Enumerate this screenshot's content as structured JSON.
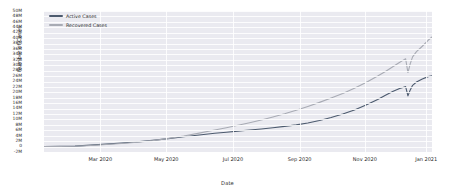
{
  "chart_data": {
    "type": "line",
    "title": "",
    "xlabel": "Date",
    "ylabel": "Number of Cases",
    "grid": true,
    "legend_position": "upper-left-inside",
    "x_tick_labels": [
      "Mar 2020",
      "May 2020",
      "Jul 2020",
      "Sep 2020",
      "Nov 2020",
      "Jan 2021"
    ],
    "x_tick_positions": [
      0.145,
      0.315,
      0.487,
      0.659,
      0.827,
      0.985
    ],
    "xlim_start": "2020-01-22",
    "xlim_end": "2021-01-10",
    "y_tick_labels": [
      "50M",
      "48M",
      "46M",
      "44M",
      "42M",
      "40M",
      "38M",
      "36M",
      "34M",
      "32M",
      "30M",
      "28M",
      "26M",
      "24M",
      "22M",
      "20M",
      "18M",
      "16M",
      "14M",
      "12M",
      "10M",
      "8M",
      "6M",
      "4M",
      "2M",
      "0",
      "-2M"
    ],
    "y_tick_values": [
      50000000,
      48000000,
      46000000,
      44000000,
      42000000,
      40000000,
      38000000,
      36000000,
      34000000,
      32000000,
      30000000,
      28000000,
      26000000,
      24000000,
      22000000,
      20000000,
      18000000,
      16000000,
      14000000,
      12000000,
      10000000,
      8000000,
      6000000,
      4000000,
      2000000,
      0,
      -2000000
    ],
    "ylim": [
      -2000000,
      50000000
    ],
    "colors": {
      "active": "#4c5a6e",
      "recovered": "#a8abb4",
      "plot_background": "#eaeaf0",
      "gridline": "#ffffff",
      "text": "#2b2b2b"
    },
    "series": [
      {
        "name": "Active Cases",
        "color": "#4c5a6e",
        "x": [
          0.0,
          0.04,
          0.08,
          0.12,
          0.16,
          0.2,
          0.24,
          0.28,
          0.32,
          0.36,
          0.4,
          0.44,
          0.47,
          0.5,
          0.53,
          0.56,
          0.59,
          0.62,
          0.65,
          0.68,
          0.71,
          0.74,
          0.77,
          0.8,
          0.83,
          0.86,
          0.88,
          0.9,
          0.915,
          0.925,
          0.932,
          0.938,
          0.944,
          0.95,
          0.96,
          0.975,
          0.99,
          1.0
        ],
        "values": [
          20000,
          60000,
          160000,
          520000,
          900000,
          1300000,
          1750000,
          2300000,
          2950000,
          3600000,
          4250000,
          4900000,
          5300000,
          5700000,
          6100000,
          6500000,
          6950000,
          7450000,
          8000000,
          8700000,
          9600000,
          10700000,
          12000000,
          13500000,
          15300000,
          17400000,
          18900000,
          20400000,
          21300000,
          21800000,
          22100000,
          18700000,
          20900000,
          22600000,
          23800000,
          24900000,
          25800000,
          26100000
        ]
      },
      {
        "name": "Recovered Cases",
        "color": "#a8abb4",
        "x": [
          0.0,
          0.04,
          0.08,
          0.12,
          0.16,
          0.2,
          0.24,
          0.28,
          0.32,
          0.36,
          0.4,
          0.44,
          0.47,
          0.5,
          0.53,
          0.56,
          0.59,
          0.62,
          0.65,
          0.68,
          0.71,
          0.74,
          0.77,
          0.8,
          0.83,
          0.86,
          0.88,
          0.9,
          0.915,
          0.925,
          0.932,
          0.938,
          0.944,
          0.95,
          0.96,
          0.975,
          0.99,
          1.0
        ],
        "values": [
          5000,
          40000,
          120000,
          400000,
          760000,
          1150000,
          1600000,
          2200000,
          3000000,
          3900000,
          4950000,
          6100000,
          6950000,
          7850000,
          8800000,
          9800000,
          10900000,
          12100000,
          13400000,
          14800000,
          16300000,
          17900000,
          19600000,
          21500000,
          23600000,
          26000000,
          27700000,
          29500000,
          30900000,
          31800000,
          32400000,
          27300000,
          30600000,
          33100000,
          35000000,
          37000000,
          39200000,
          40400000
        ]
      }
    ]
  }
}
